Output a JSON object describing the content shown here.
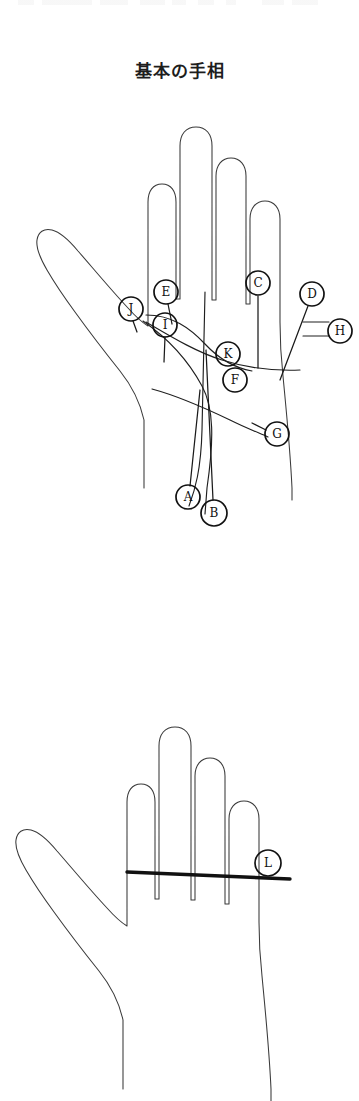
{
  "page": {
    "title": "基本の手相",
    "background_color": "#ffffff",
    "ink_color": "#1f1f1f",
    "width": 359,
    "height": 1101
  },
  "figures": [
    {
      "id": "palm-lines-diagram",
      "name": "labelled-palm-diagram",
      "caption": "基本の手相",
      "hand": "left-palm-front-view",
      "markers": [
        {
          "letter": "A",
          "cx": 188,
          "cy": 407,
          "r": 12
        },
        {
          "letter": "B",
          "cx": 214,
          "cy": 423,
          "r": 13
        },
        {
          "letter": "C",
          "cx": 258,
          "cy": 193,
          "r": 12
        },
        {
          "letter": "D",
          "cx": 312,
          "cy": 204,
          "r": 12
        },
        {
          "letter": "E",
          "cx": 166,
          "cy": 202,
          "r": 12
        },
        {
          "letter": "F",
          "cx": 235,
          "cy": 290,
          "r": 12
        },
        {
          "letter": "G",
          "cx": 277,
          "cy": 344,
          "r": 12
        },
        {
          "letter": "H",
          "cx": 340,
          "cy": 241,
          "r": 12
        },
        {
          "letter": "I",
          "cx": 165,
          "cy": 235,
          "r": 12
        },
        {
          "letter": "J",
          "cx": 131,
          "cy": 219,
          "r": 12
        },
        {
          "letter": "K",
          "cx": 228,
          "cy": 264,
          "r": 12
        }
      ]
    },
    {
      "id": "plain-hand-diagram",
      "name": "single-line-palm-diagram",
      "hand": "left-palm-front-view",
      "markers": [
        {
          "letter": "L",
          "cx": 268,
          "cy": 263,
          "r": 13
        }
      ]
    }
  ]
}
